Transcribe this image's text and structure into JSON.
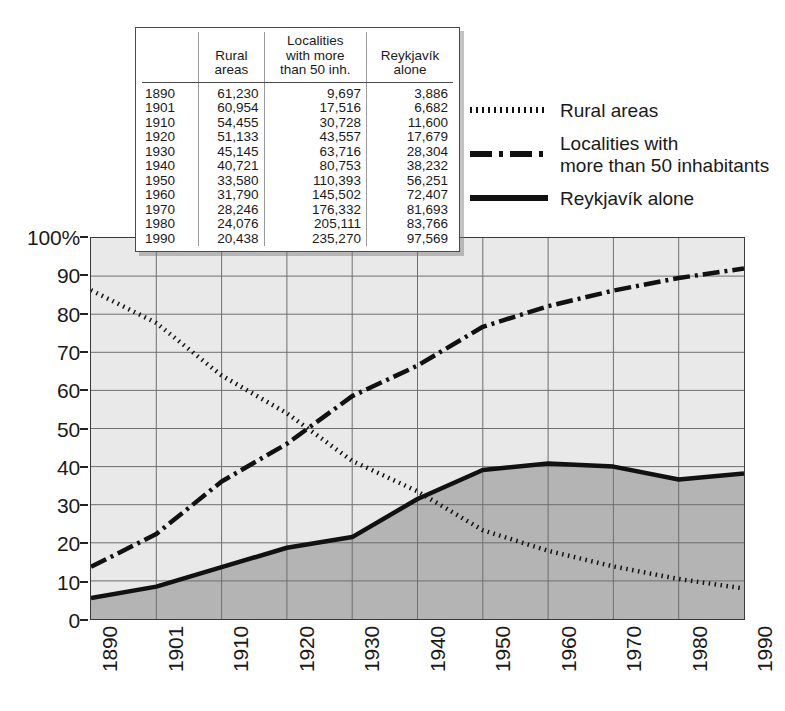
{
  "chart_data": {
    "type": "line",
    "title": "",
    "xlabel": "",
    "ylabel": "",
    "categories": [
      "1890",
      "1901",
      "1910",
      "1920",
      "1930",
      "1940",
      "1950",
      "1960",
      "1970",
      "1980",
      "1990"
    ],
    "x": [
      1890,
      1901,
      1910,
      1920,
      1930,
      1940,
      1950,
      1960,
      1970,
      1980,
      1990
    ],
    "ylim": [
      0,
      100
    ],
    "y_unit": "%",
    "y_ticks": [
      "0",
      "10",
      "20",
      "30",
      "40",
      "50",
      "60",
      "70",
      "80",
      "90",
      "100%"
    ],
    "y_tick_values": [
      0,
      10,
      20,
      30,
      40,
      50,
      60,
      70,
      80,
      90,
      100
    ],
    "grid": true,
    "legend_position": "top-right",
    "series": [
      {
        "name": "Rural areas",
        "style": "dotted",
        "values": [
          86.3,
          77.7,
          63.9,
          54.0,
          41.5,
          33.5,
          23.3,
          17.9,
          13.8,
          10.5,
          8.0
        ]
      },
      {
        "name": "Localities with more than 50 inhabitants",
        "style": "dash-dot",
        "values": [
          13.7,
          22.3,
          36.1,
          46.0,
          58.5,
          66.5,
          76.7,
          82.1,
          86.2,
          89.5,
          92.0
        ]
      },
      {
        "name": "Reykjavík alone",
        "style": "solid",
        "values": [
          5.5,
          8.5,
          13.6,
          18.7,
          21.5,
          31.5,
          39.1,
          40.8,
          40.0,
          36.6,
          38.2
        ]
      }
    ]
  },
  "legend": {
    "items": [
      {
        "label": "Rural areas",
        "style": "dotted"
      },
      {
        "label": "Localities with\nmore than 50 inhabitants",
        "style": "dash-dot"
      },
      {
        "label": "Reykjavík alone",
        "style": "solid"
      }
    ]
  },
  "data_table": {
    "columns": [
      "",
      "Rural\nareas",
      "Localities\nwith more\nthan 50 inh.",
      "Reykjavík\nalone"
    ],
    "rows": [
      {
        "year": "1890",
        "rural": "61,230",
        "localities": "9,697",
        "reykjavik": "3,886"
      },
      {
        "year": "1901",
        "rural": "60,954",
        "localities": "17,516",
        "reykjavik": "6,682"
      },
      {
        "year": "1910",
        "rural": "54,455",
        "localities": "30,728",
        "reykjavik": "11,600"
      },
      {
        "year": "1920",
        "rural": "51,133",
        "localities": "43,557",
        "reykjavik": "17,679"
      },
      {
        "year": "1930",
        "rural": "45,145",
        "localities": "63,716",
        "reykjavik": "28,304"
      },
      {
        "year": "1940",
        "rural": "40,721",
        "localities": "80,753",
        "reykjavik": "38,232"
      },
      {
        "year": "1950",
        "rural": "33,580",
        "localities": "110,393",
        "reykjavik": "56,251"
      },
      {
        "year": "1960",
        "rural": "31,790",
        "localities": "145,502",
        "reykjavik": "72,407"
      },
      {
        "year": "1970",
        "rural": "28,246",
        "localities": "176,332",
        "reykjavik": "81,693"
      },
      {
        "year": "1980",
        "rural": "24,076",
        "localities": "205,111",
        "reykjavik": "83,766"
      },
      {
        "year": "1990",
        "rural": "20,438",
        "localities": "235,270",
        "reykjavik": "97,569"
      }
    ]
  },
  "colors": {
    "plot_background": "#e9e9e9",
    "area_fill": "#b4b4b4",
    "grid": "#6e6e6e",
    "line": "#111111",
    "frame": "#3a3a3a",
    "table_background": "#ffffff"
  }
}
